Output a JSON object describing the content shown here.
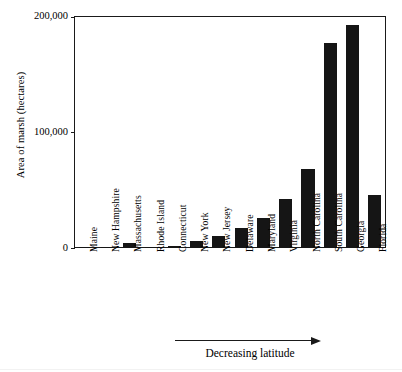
{
  "chart_data": {
    "type": "bar",
    "title": "",
    "xlabel": "Decreasing latitude",
    "ylabel": "Area of marsh (hectares)",
    "categories": [
      "Maine",
      "New Hampshire",
      "Massachusetts",
      "Rhode Island",
      "Connecticut",
      "New York",
      "New Jersey",
      "Delaware",
      "Maryland",
      "Virginia",
      "North Carolina",
      "South Carolina",
      "Georgia",
      "Florida"
    ],
    "values": [
      1000,
      1000,
      4000,
      800,
      1500,
      6000,
      10000,
      17000,
      26000,
      42000,
      68000,
      177000,
      192000,
      46000
    ],
    "ylim": [
      0,
      200000
    ],
    "yticks": [
      0,
      100000,
      200000
    ],
    "ytick_labels": [
      "0",
      "100,000",
      "200,000"
    ],
    "grid": false,
    "legend": false,
    "legend_position": "none",
    "bar_color": "#151515",
    "axis_color": "#1a1a1a",
    "background_color": "#ffffff",
    "annotations": [
      {
        "name": "decreasing-latitude-arrow",
        "text": "Decreasing latitude",
        "direction": "right"
      }
    ]
  },
  "axes": {
    "y_title": "Area of marsh (hectares)",
    "x_caption": "Decreasing latitude"
  }
}
